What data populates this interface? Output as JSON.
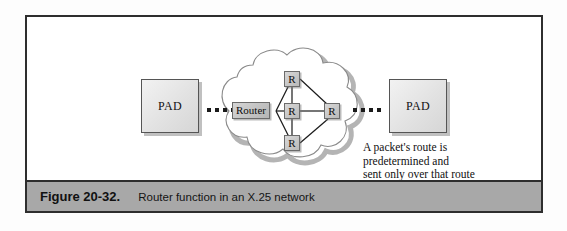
{
  "figure": {
    "caption_number": "Figure 20-32.",
    "caption_text": "Router function in an X.25 network"
  },
  "nodes": {
    "pad_left_label": "PAD",
    "pad_right_label": "PAD",
    "router_tag_label": "Router",
    "router_top_label": "R",
    "router_center_label": "R",
    "router_right_label": "R",
    "router_bottom_label": "R"
  },
  "annotation": {
    "line1": "A packet's route is",
    "line2": "predetermined and",
    "line3": "sent only over that route"
  },
  "colors": {
    "frame_border": "#2e2e2e",
    "caption_bar": "#a8a8a8",
    "node_fill": "#c9c9c9",
    "pad_fill": "#e6e6e6",
    "cloud_stroke": "#8a8a8a",
    "cloud_shadow": "#b0b0b0"
  }
}
